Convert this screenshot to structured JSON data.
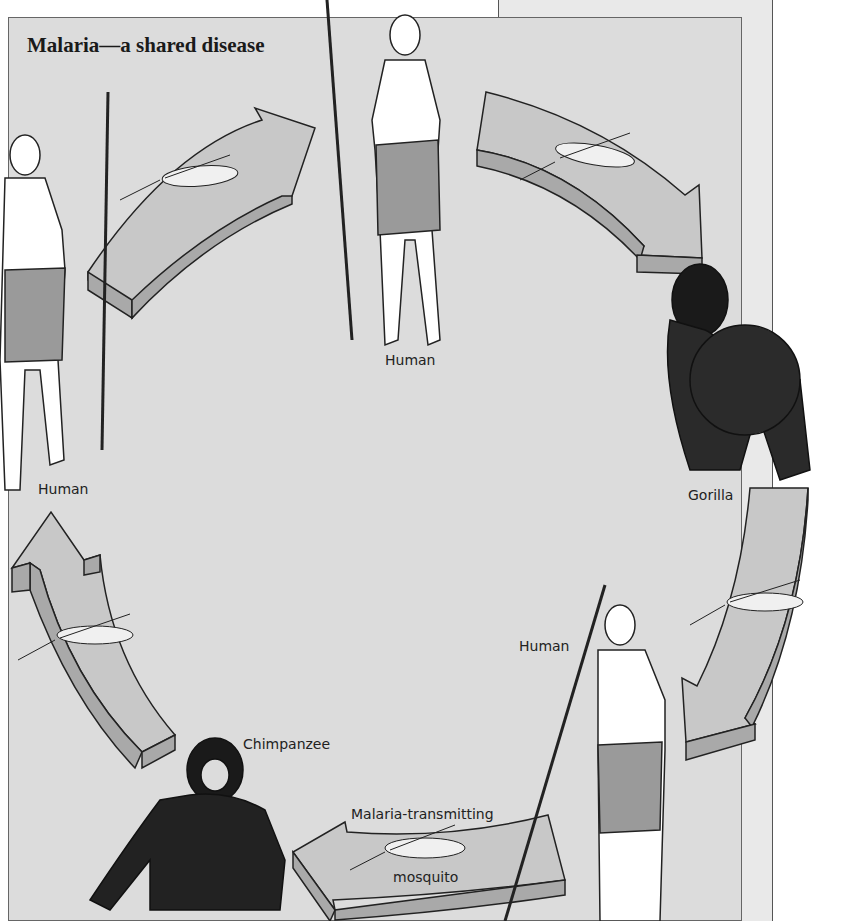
{
  "title": "Malaria—a shared disease",
  "labels": {
    "human_top": "Human",
    "human_left": "Human",
    "gorilla": "Gorilla",
    "human_right": "Human",
    "chimpanzee": "Chimpanzee",
    "mosquito_line1": "Malaria-transmitting",
    "mosquito_line2": "mosquito"
  },
  "colors": {
    "panel_bg": "#dcdcdc",
    "back_panel_bg": "#e9e9e9",
    "arrow_top": "#c8c8c8",
    "arrow_side": "#a9a9a9",
    "outline": "#222222"
  },
  "cycle": [
    "Human",
    "Gorilla",
    "Human",
    "Malaria-transmitting mosquito",
    "Chimpanzee",
    "Human",
    "Human"
  ]
}
